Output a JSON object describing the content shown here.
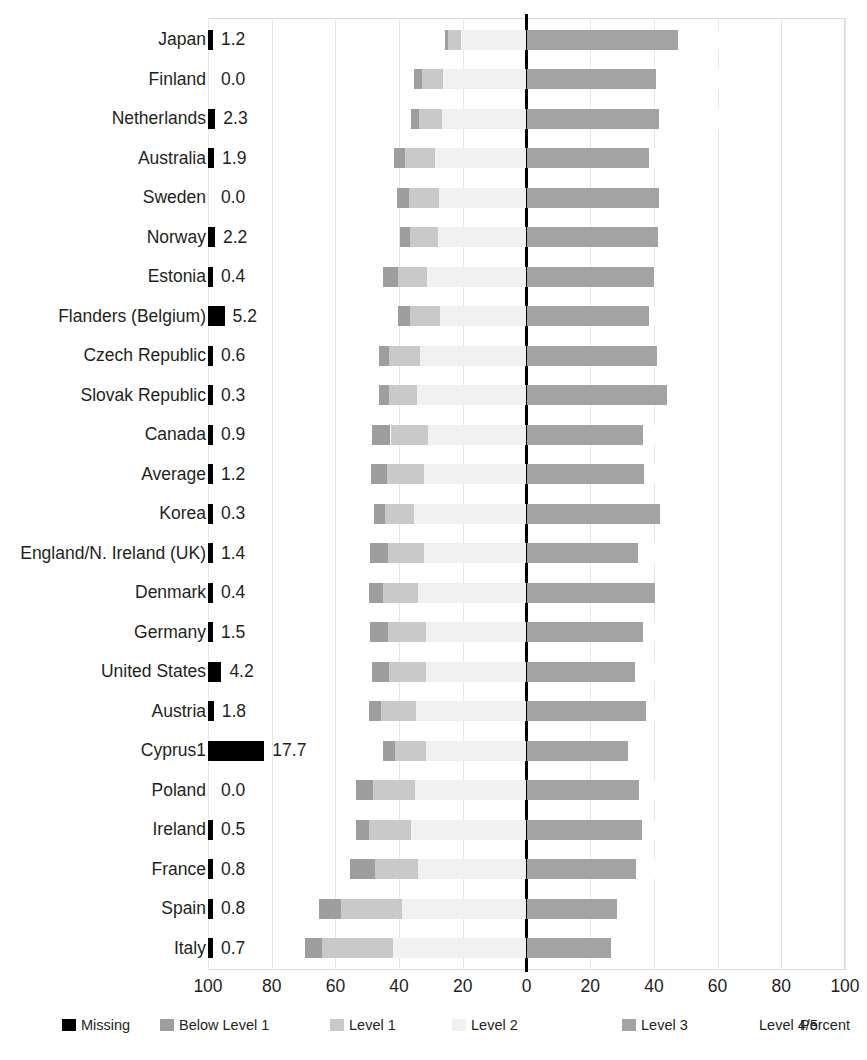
{
  "chart_data": {
    "type": "bar",
    "subtype": "diverging-stacked-bar",
    "title": "",
    "xlabel": "Percent",
    "ylabel": "",
    "xlim": [
      -100,
      100
    ],
    "xticks": [
      "100",
      "80",
      "60",
      "40",
      "20",
      "0",
      "20",
      "40",
      "60",
      "80",
      "100"
    ],
    "xtick_values": [
      -100,
      -80,
      -60,
      -40,
      -20,
      0,
      20,
      40,
      60,
      80,
      100
    ],
    "grid": true,
    "legend_position": "bottom",
    "legend": [
      {
        "label": "Missing",
        "color": "#000000"
      },
      {
        "label": "Below Level 1",
        "color": "#9e9e9e"
      },
      {
        "label": "Level 1",
        "color": "#c9c9c9"
      },
      {
        "label": "Level 2",
        "color": "#f1f1f1"
      },
      {
        "label": "Level 3",
        "color": "#a3a3a3"
      },
      {
        "label": "Level 4/5",
        "color": "#ffffff"
      }
    ],
    "unit_label": "Percent",
    "series_names": [
      "Missing",
      "Below Level 1",
      "Level 1",
      "Level 2",
      "Level 3",
      "Level 4/5"
    ],
    "categories": [
      "Japan",
      "Finland",
      "Netherlands",
      "Australia",
      "Sweden",
      "Norway",
      "Estonia",
      "Flanders (Belgium)",
      "Czech Republic",
      "Slovak Republic",
      "Canada",
      "Average",
      "Korea",
      "England/N. Ireland (UK)",
      "Denmark",
      "Germany",
      "United States",
      "Austria",
      "Cyprus1",
      "Poland",
      "Ireland",
      "France",
      "Spain",
      "Italy"
    ],
    "rows": [
      {
        "category": "Japan",
        "missing": 1.2,
        "below_level_1": 1.2,
        "level_1": 3.9,
        "level_2": 20.6,
        "level_3": 47.6,
        "level_4_5": 25.5
      },
      {
        "category": "Finland",
        "missing": 0.0,
        "below_level_1": 2.6,
        "level_1": 6.6,
        "level_2": 26.1,
        "level_3": 40.6,
        "level_4_5": 24.1
      },
      {
        "category": "Netherlands",
        "missing": 2.3,
        "below_level_1": 2.6,
        "level_1": 7.2,
        "level_2": 26.5,
        "level_3": 41.5,
        "level_4_5": 19.9
      },
      {
        "category": "Australia",
        "missing": 1.9,
        "below_level_1": 3.4,
        "level_1": 9.4,
        "level_2": 28.7,
        "level_3": 38.5,
        "level_4_5": 18.1
      },
      {
        "category": "Sweden",
        "missing": 0.0,
        "below_level_1": 3.7,
        "level_1": 9.5,
        "level_2": 27.4,
        "level_3": 41.6,
        "level_4_5": 17.8
      },
      {
        "category": "Norway",
        "missing": 2.2,
        "below_level_1": 3.2,
        "level_1": 8.8,
        "level_2": 27.8,
        "level_3": 41.4,
        "level_4_5": 16.6
      },
      {
        "category": "Estonia",
        "missing": 0.4,
        "below_level_1": 4.9,
        "level_1": 8.9,
        "level_2": 31.3,
        "level_3": 40.0,
        "level_4_5": 14.5
      },
      {
        "category": "Flanders (Belgium)",
        "missing": 5.2,
        "below_level_1": 3.6,
        "level_1": 9.6,
        "level_2": 27.1,
        "level_3": 38.5,
        "level_4_5": 16.0
      },
      {
        "category": "Czech Republic",
        "missing": 0.6,
        "below_level_1": 3.0,
        "level_1": 9.9,
        "level_2": 33.3,
        "level_3": 41.0,
        "level_4_5": 12.2
      },
      {
        "category": "Slovak Republic",
        "missing": 0.3,
        "below_level_1": 3.0,
        "level_1": 8.9,
        "level_2": 34.3,
        "level_3": 44.1,
        "level_4_5": 9.4
      },
      {
        "category": "Canada",
        "missing": 0.9,
        "below_level_1": 5.8,
        "level_1": 11.8,
        "level_2": 30.9,
        "level_3": 36.6,
        "level_4_5": 14.0
      },
      {
        "category": "Average",
        "missing": 1.2,
        "below_level_1": 5.1,
        "level_1": 11.5,
        "level_2": 32.2,
        "level_3": 37.0,
        "level_4_5": 13.0
      },
      {
        "category": "Korea",
        "missing": 0.3,
        "below_level_1": 3.4,
        "level_1": 9.0,
        "level_2": 35.4,
        "level_3": 41.8,
        "level_4_5": 10.1
      },
      {
        "category": "England/N. Ireland (UK)",
        "missing": 1.4,
        "below_level_1": 5.5,
        "level_1": 11.3,
        "level_2": 32.3,
        "level_3": 35.1,
        "level_4_5": 14.4
      },
      {
        "category": "Denmark",
        "missing": 0.4,
        "below_level_1": 4.3,
        "level_1": 11.2,
        "level_2": 34.0,
        "level_3": 40.2,
        "level_4_5": 9.9
      },
      {
        "category": "Germany",
        "missing": 1.5,
        "below_level_1": 5.6,
        "level_1": 12.0,
        "level_2": 31.4,
        "level_3": 36.5,
        "level_4_5": 13.0
      },
      {
        "category": "United States",
        "missing": 4.2,
        "below_level_1": 5.1,
        "level_1": 11.9,
        "level_2": 31.4,
        "level_3": 34.2,
        "level_4_5": 13.1
      },
      {
        "category": "Austria",
        "missing": 1.8,
        "below_level_1": 3.8,
        "level_1": 11.1,
        "level_2": 34.7,
        "level_3": 37.5,
        "level_4_5": 11.0
      },
      {
        "category": "Cyprus1",
        "missing": 17.7,
        "below_level_1": 3.6,
        "level_1": 10.0,
        "level_2": 31.4,
        "level_3": 31.9,
        "level_4_5": 5.4
      },
      {
        "category": "Poland",
        "missing": 0.0,
        "below_level_1": 5.4,
        "level_1": 13.1,
        "level_2": 35.0,
        "level_3": 35.4,
        "level_4_5": 11.1
      },
      {
        "category": "Ireland",
        "missing": 0.5,
        "below_level_1": 4.3,
        "level_1": 13.0,
        "level_2": 36.3,
        "level_3": 36.4,
        "level_4_5": 9.5
      },
      {
        "category": "France",
        "missing": 0.8,
        "below_level_1": 7.7,
        "level_1": 13.5,
        "level_2": 34.2,
        "level_3": 34.3,
        "level_4_5": 9.5
      },
      {
        "category": "Spain",
        "missing": 0.8,
        "below_level_1": 7.2,
        "level_1": 19.0,
        "level_2": 39.1,
        "level_3": 28.3,
        "level_4_5": 5.6
      },
      {
        "category": "Italy",
        "missing": 0.7,
        "below_level_1": 5.5,
        "level_1": 22.2,
        "level_2": 42.0,
        "level_3": 26.5,
        "level_4_5": 3.3
      }
    ]
  }
}
